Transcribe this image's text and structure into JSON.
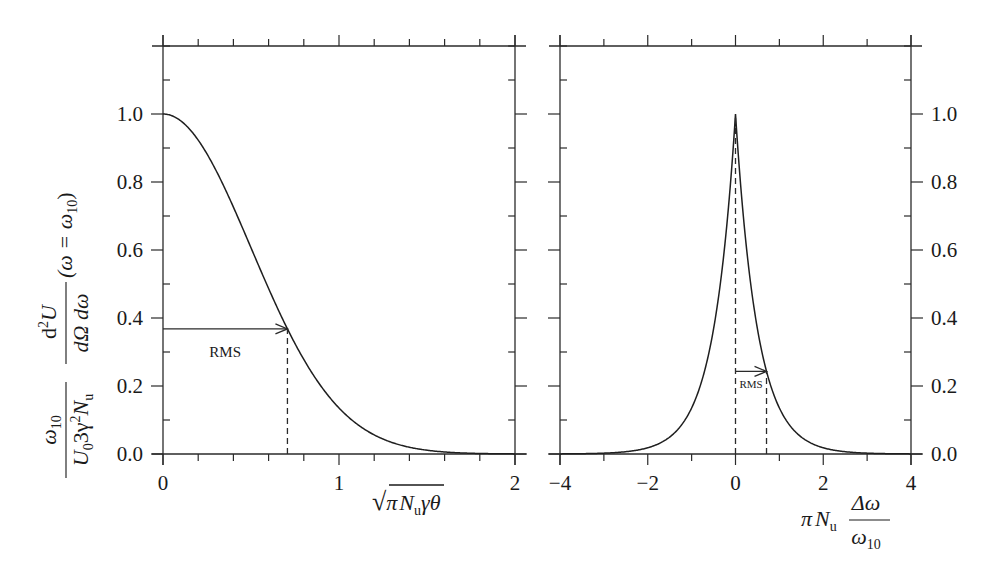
{
  "chart_data": [
    {
      "type": "line",
      "panel": "left",
      "title": "",
      "xlabel": "√(π N_u) γ θ",
      "ylabel": "ω10 / (U0 3γ² N_u) · d²U/(dΩ dω) (ω = ω10)",
      "xlim": [
        0,
        2
      ],
      "ylim": [
        0,
        1.2
      ],
      "x_ticks": [
        0,
        1,
        2
      ],
      "x_tick_labels": [
        "0",
        "1",
        "2"
      ],
      "x_minor_step": 0.2,
      "y_ticks": [
        0.0,
        0.2,
        0.4,
        0.6,
        0.8,
        1.0
      ],
      "y_tick_labels": [
        "0.0",
        "0.2",
        "0.4",
        "0.6",
        "0.8",
        "1.0"
      ],
      "y_minor_step": 0.1,
      "grid": false,
      "series": [
        {
          "name": "angular distribution",
          "function": "exp(-2 x^2)",
          "x": [
            0,
            0.1,
            0.2,
            0.3,
            0.4,
            0.5,
            0.6,
            0.7,
            0.8,
            0.9,
            1.0,
            1.1,
            1.2,
            1.3,
            1.4,
            1.5,
            1.6,
            1.7,
            1.8,
            1.9,
            2.0
          ],
          "y": [
            1.0,
            0.98,
            0.923,
            0.835,
            0.726,
            0.607,
            0.487,
            0.375,
            0.278,
            0.198,
            0.135,
            0.089,
            0.056,
            0.034,
            0.02,
            0.011,
            0.006,
            0.003,
            0.002,
            0.001,
            0.0003
          ]
        }
      ],
      "annotations": [
        {
          "type": "arrow",
          "label": "RMS",
          "from": [
            0,
            0.368
          ],
          "to": [
            0.707,
            0.368
          ]
        },
        {
          "type": "dashed-vline",
          "x": 0.707,
          "y_from": 0,
          "y_to": 0.368
        }
      ]
    },
    {
      "type": "line",
      "panel": "right",
      "title": "",
      "xlabel": "π N_u Δω / ω10",
      "ylabel": "",
      "xlim": [
        -4,
        4
      ],
      "ylim": [
        0,
        1.2
      ],
      "x_ticks": [
        -4,
        -2,
        0,
        2,
        4
      ],
      "x_tick_labels": [
        "−4",
        "−2",
        "0",
        "2",
        "4"
      ],
      "x_minor_step": 1,
      "y_ticks": [
        0.0,
        0.2,
        0.4,
        0.6,
        0.8,
        1.0
      ],
      "y_tick_labels": [
        "0.0",
        "0.2",
        "0.4",
        "0.6",
        "0.8",
        "1.0"
      ],
      "y_minor_step": 0.1,
      "y_axis_side": "right",
      "grid": false,
      "series": [
        {
          "name": "spectral distribution",
          "function": "exp(-2 |x|)",
          "x": [
            -4,
            -3.5,
            -3,
            -2.5,
            -2,
            -1.5,
            -1,
            -0.75,
            -0.5,
            -0.25,
            0,
            0.25,
            0.5,
            0.75,
            1,
            1.5,
            2,
            2.5,
            3,
            3.5,
            4
          ],
          "y": [
            0.0003,
            0.0009,
            0.0025,
            0.0067,
            0.018,
            0.05,
            0.135,
            0.223,
            0.368,
            0.607,
            1.0,
            0.607,
            0.368,
            0.223,
            0.135,
            0.05,
            0.018,
            0.0067,
            0.0025,
            0.0009,
            0.0003
          ]
        }
      ],
      "annotations": [
        {
          "type": "dashed-vline",
          "x": 0,
          "y_from": 0,
          "y_to": 1.0
        },
        {
          "type": "arrow",
          "label": "RMS",
          "from": [
            0,
            0.243
          ],
          "to": [
            0.707,
            0.243
          ]
        },
        {
          "type": "dashed-vline",
          "x": 0.707,
          "y_from": 0,
          "y_to": 0.243
        }
      ]
    }
  ],
  "labels": {
    "left_xlabel_sqrt": "√",
    "left_xlabel_pi": "π",
    "left_xlabel_N": "N",
    "left_xlabel_sub_u": "u",
    "left_xlabel_rest": "γθ",
    "right_xlabel_prefix_pi": "π",
    "right_xlabel_N": "N",
    "right_xlabel_sub_u": "u",
    "right_xlabel_num": "Δω",
    "right_xlabel_den": "ω",
    "right_xlabel_den_sub": "10",
    "ylabel_num_omega": "ω",
    "ylabel_num_sub": "10",
    "ylabel_den": "U",
    "ylabel_den_sub0": "0",
    "ylabel_den_rest": "3γ",
    "ylabel_den_sup2": "2",
    "ylabel_den_N": "N",
    "ylabel_den_sub_u": "u",
    "ylabel_frac2_num": "d",
    "ylabel_frac2_num_sup": "2",
    "ylabel_frac2_num_U": "U",
    "ylabel_frac2_den": "dΩ dω",
    "ylabel_cond": "(ω = ω",
    "ylabel_cond_sub": "10",
    "ylabel_cond_close": ")",
    "rms": "RMS"
  }
}
